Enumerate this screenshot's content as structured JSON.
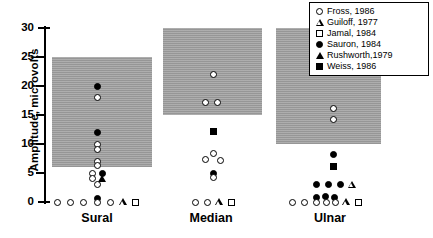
{
  "chart_data": {
    "type": "scatter",
    "title": "",
    "xlabel": "",
    "ylabel": "Amplitude, microvolts",
    "ylim": [
      0,
      30
    ],
    "yticks": [
      0,
      5,
      10,
      15,
      20,
      25,
      30
    ],
    "ytick_labels": [
      "0",
      "5",
      "10",
      "15",
      "20",
      "25",
      "30"
    ],
    "grid": false,
    "legend_position": "top-right",
    "categories": [
      "Sural",
      "Median",
      "Ulnar"
    ],
    "legend": [
      {
        "label": "Fross, 1986",
        "marker": "circle-open"
      },
      {
        "label": "Guiloff, 1977",
        "marker": "triangle-open"
      },
      {
        "label": "Jamal, 1984",
        "marker": "square-open"
      },
      {
        "label": "Sauron, 1984",
        "marker": "circle-filled"
      },
      {
        "label": "Rushworth,1979",
        "marker": "triangle-filled"
      },
      {
        "label": "Weiss, 1986",
        "marker": "square-filled"
      }
    ],
    "normal_bands": [
      {
        "category": "Sural",
        "low": 6,
        "high": 25
      },
      {
        "category": "Median",
        "low": 15,
        "high": 30
      },
      {
        "category": "Ulnar",
        "low": 10,
        "high": 30
      }
    ],
    "points": [
      {
        "category": "Sural",
        "series": "Sauron, 1984",
        "marker": "circle-filled",
        "x_offset": 0,
        "value": 20
      },
      {
        "category": "Sural",
        "series": "Fross, 1986",
        "marker": "circle-open",
        "x_offset": 0,
        "value": 18
      },
      {
        "category": "Sural",
        "series": "Sauron, 1984",
        "marker": "circle-filled",
        "x_offset": 0,
        "value": 12
      },
      {
        "category": "Sural",
        "series": "Fross, 1986",
        "marker": "circle-open",
        "x_offset": 0,
        "value": 10
      },
      {
        "category": "Sural",
        "series": "Fross, 1986",
        "marker": "circle-open",
        "x_offset": 0,
        "value": 9
      },
      {
        "category": "Sural",
        "series": "Fross, 1986",
        "marker": "circle-open",
        "x_offset": 0,
        "value": 7
      },
      {
        "category": "Sural",
        "series": "Fross, 1986",
        "marker": "circle-open",
        "x_offset": 0,
        "value": 6.3
      },
      {
        "category": "Sural",
        "series": "Fross, 1986",
        "marker": "circle-open",
        "x_offset": -5,
        "value": 5
      },
      {
        "category": "Sural",
        "series": "Fross, 1986",
        "marker": "circle-open",
        "x_offset": -5,
        "value": 4
      },
      {
        "category": "Sural",
        "series": "Sauron, 1984",
        "marker": "circle-filled",
        "x_offset": 5,
        "value": 5
      },
      {
        "category": "Sural",
        "series": "Rushworth,1979",
        "marker": "triangle-filled",
        "x_offset": 5,
        "value": 4
      },
      {
        "category": "Sural",
        "series": "Fross, 1986",
        "marker": "circle-open",
        "x_offset": 0,
        "value": 3
      },
      {
        "category": "Sural",
        "series": "Fross, 1986",
        "marker": "circle-open",
        "x_offset": -40,
        "value": 0
      },
      {
        "category": "Sural",
        "series": "Fross, 1986",
        "marker": "circle-open",
        "x_offset": -27,
        "value": 0
      },
      {
        "category": "Sural",
        "series": "Fross, 1986",
        "marker": "circle-open",
        "x_offset": -14,
        "value": 0
      },
      {
        "category": "Sural",
        "series": "Sauron, 1984",
        "marker": "circle-filled",
        "x_offset": 0,
        "value": 0.6
      },
      {
        "category": "Sural",
        "series": "Fross, 1986",
        "marker": "circle-open",
        "x_offset": 0,
        "value": 0
      },
      {
        "category": "Sural",
        "series": "Fross, 1986",
        "marker": "circle-open",
        "x_offset": 13,
        "value": 0
      },
      {
        "category": "Sural",
        "series": "Guiloff, 1977",
        "marker": "triangle-open",
        "x_offset": 26,
        "value": 0
      },
      {
        "category": "Sural",
        "series": "Jamal, 1984",
        "marker": "square-open",
        "x_offset": 38,
        "value": 0
      },
      {
        "category": "Median",
        "series": "Fross, 1986",
        "marker": "circle-open",
        "x_offset": 2,
        "value": 22
      },
      {
        "category": "Median",
        "series": "Fross, 1986",
        "marker": "circle-open",
        "x_offset": -6,
        "value": 17.2
      },
      {
        "category": "Median",
        "series": "Fross, 1986",
        "marker": "circle-open",
        "x_offset": 6,
        "value": 17.2
      },
      {
        "category": "Median",
        "series": "Weiss, 1986",
        "marker": "square-filled",
        "x_offset": 2,
        "value": 12.2
      },
      {
        "category": "Median",
        "series": "Fross, 1986",
        "marker": "circle-open",
        "x_offset": 2,
        "value": 8.4
      },
      {
        "category": "Median",
        "series": "Fross, 1986",
        "marker": "circle-open",
        "x_offset": -6,
        "value": 7.3
      },
      {
        "category": "Median",
        "series": "Fross, 1986",
        "marker": "circle-open",
        "x_offset": 9,
        "value": 7.2
      },
      {
        "category": "Median",
        "series": "Sauron, 1984",
        "marker": "circle-filled",
        "x_offset": 2,
        "value": 4.9
      },
      {
        "category": "Median",
        "series": "Fross, 1986",
        "marker": "circle-open",
        "x_offset": 2,
        "value": 4.2
      },
      {
        "category": "Median",
        "series": "Fross, 1986",
        "marker": "circle-open",
        "x_offset": -16,
        "value": 0
      },
      {
        "category": "Median",
        "series": "Fross, 1986",
        "marker": "circle-open",
        "x_offset": -4,
        "value": 0
      },
      {
        "category": "Median",
        "series": "Guiloff, 1977",
        "marker": "triangle-open",
        "x_offset": 8,
        "value": 0
      },
      {
        "category": "Median",
        "series": "Jamal, 1984",
        "marker": "square-open",
        "x_offset": 20,
        "value": 0
      },
      {
        "category": "Ulnar",
        "series": "Sauron, 1984",
        "marker": "circle-filled",
        "x_offset": 3,
        "value": 25.2
      },
      {
        "category": "Ulnar",
        "series": "Fross, 1986",
        "marker": "circle-open",
        "x_offset": 3,
        "value": 16.2
      },
      {
        "category": "Ulnar",
        "series": "Fross, 1986",
        "marker": "circle-open",
        "x_offset": 3,
        "value": 14.2
      },
      {
        "category": "Ulnar",
        "series": "Sauron, 1984",
        "marker": "circle-filled",
        "x_offset": 3,
        "value": 8.2
      },
      {
        "category": "Ulnar",
        "series": "Weiss, 1986",
        "marker": "square-filled",
        "x_offset": 3,
        "value": 6.2
      },
      {
        "category": "Ulnar",
        "series": "Sauron, 1984",
        "marker": "circle-filled",
        "x_offset": -14,
        "value": 3
      },
      {
        "category": "Ulnar",
        "series": "Sauron, 1984",
        "marker": "circle-filled",
        "x_offset": -2,
        "value": 3
      },
      {
        "category": "Ulnar",
        "series": "Sauron, 1984",
        "marker": "circle-filled",
        "x_offset": 10,
        "value": 3
      },
      {
        "category": "Ulnar",
        "series": "Guiloff, 1977",
        "marker": "triangle-open",
        "x_offset": 22,
        "value": 3
      },
      {
        "category": "Ulnar",
        "series": "Fross, 1986",
        "marker": "circle-open",
        "x_offset": -38,
        "value": 0
      },
      {
        "category": "Ulnar",
        "series": "Fross, 1986",
        "marker": "circle-open",
        "x_offset": -26,
        "value": 0
      },
      {
        "category": "Ulnar",
        "series": "Sauron, 1984",
        "marker": "circle-filled",
        "x_offset": -14,
        "value": 0.7
      },
      {
        "category": "Ulnar",
        "series": "Fross, 1986",
        "marker": "circle-open",
        "x_offset": -14,
        "value": 0
      },
      {
        "category": "Ulnar",
        "series": "Sauron, 1984",
        "marker": "circle-filled",
        "x_offset": -5,
        "value": 0.9
      },
      {
        "category": "Ulnar",
        "series": "Fross, 1986",
        "marker": "circle-open",
        "x_offset": -4,
        "value": 0
      },
      {
        "category": "Ulnar",
        "series": "Sauron, 1984",
        "marker": "circle-filled",
        "x_offset": 4,
        "value": 0.7
      },
      {
        "category": "Ulnar",
        "series": "Fross, 1986",
        "marker": "circle-open",
        "x_offset": 5,
        "value": 0
      },
      {
        "category": "Ulnar",
        "series": "Guiloff, 1977",
        "marker": "triangle-open",
        "x_offset": 16,
        "value": 0
      },
      {
        "category": "Ulnar",
        "series": "Jamal, 1984",
        "marker": "square-open",
        "x_offset": 28,
        "value": 0
      }
    ]
  },
  "caption": ""
}
